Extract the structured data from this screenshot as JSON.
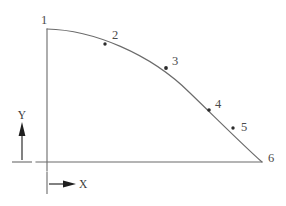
{
  "diagram": {
    "background_color": "#ffffff",
    "line_color": "#6b6b6b",
    "marker_color": "#2b2b2b",
    "label_color": "#4a4a4a",
    "axes": {
      "x_label": "X",
      "y_label": "Y",
      "x_indicator_name": "x-direction-arrow",
      "y_indicator_name": "y-direction-arrow"
    },
    "nodes": [
      {
        "id": "1",
        "label": "1",
        "x": 47,
        "y": 29,
        "label_x": 44,
        "label_y": 24,
        "marker": "none"
      },
      {
        "id": "2",
        "label": "2",
        "x": 105,
        "y": 44,
        "label_x": 112,
        "label_y": 39,
        "marker": "dot"
      },
      {
        "id": "3",
        "label": "3",
        "x": 166,
        "y": 68,
        "label_x": 172,
        "label_y": 65,
        "marker": "dot"
      },
      {
        "id": "4",
        "label": "4",
        "x": 209,
        "y": 110,
        "label_x": 215,
        "label_y": 108,
        "marker": "dot"
      },
      {
        "id": "5",
        "label": "5",
        "x": 233,
        "y": 128,
        "label_x": 241,
        "label_y": 131,
        "marker": "dot"
      },
      {
        "id": "6",
        "label": "6",
        "x": 262,
        "y": 162,
        "label_x": 268,
        "label_y": 162,
        "marker": "none"
      }
    ],
    "curve": {
      "description": "Convex arc from node 1 to node 6",
      "path": "M 47 29 C 92 30, 150 53, 190 93 C 220 122, 244 146, 262 162"
    },
    "vertical_axis_line": {
      "x": 47,
      "y_top": 29,
      "y_bottom": 171
    },
    "horizontal_axis_line": {
      "y": 162,
      "x_left": 36,
      "x_right": 262
    }
  }
}
